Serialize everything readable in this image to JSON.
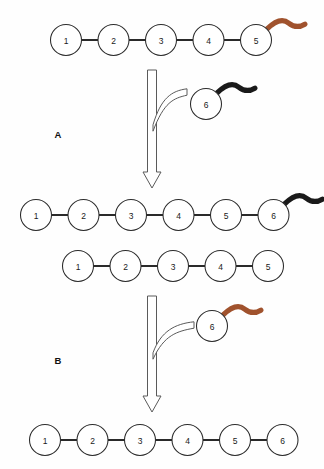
{
  "figure": {
    "background_color": "#fefefe",
    "ink_color": "#1f1f1f",
    "panels": [
      {
        "id": "A",
        "label": "A",
        "label_x": 58,
        "label_y": 134
      },
      {
        "id": "B",
        "label": "B",
        "label_x": 58,
        "label_y": 360
      }
    ],
    "colors": {
      "tail_brown": "#A0522D",
      "tail_black": "#1a1a1a",
      "circle_stroke": "#2b2b2b",
      "circle_fill": "#ffffff",
      "link": "#1f1f1f",
      "arrow_stroke": "#5a5a5a",
      "arrow_fill": "#ffffff"
    },
    "geometry": {
      "circle_radius": 15.5,
      "circle_spacing": 47.5
    },
    "chains": [
      {
        "name": "panel-a-substrate-chain",
        "panel": "A",
        "start_x": 66,
        "y": 40,
        "spacing": 47.5,
        "nodes": [
          "1",
          "2",
          "3",
          "4",
          "5"
        ],
        "tail": {
          "attached_to": "5",
          "color": "#A0522D",
          "color_name": "brown"
        }
      },
      {
        "name": "panel-a-incoming-unit",
        "panel": "A",
        "start_x": 206,
        "y": 104,
        "spacing": 47.5,
        "nodes": [
          "6"
        ],
        "tail": {
          "attached_to": "6",
          "color": "#1a1a1a",
          "color_name": "black"
        }
      },
      {
        "name": "panel-a-product-chain",
        "panel": "A",
        "start_x": 36,
        "y": 215,
        "spacing": 47.5,
        "nodes": [
          "1",
          "2",
          "3",
          "4",
          "5",
          "6"
        ],
        "tail": {
          "attached_to": "6",
          "color": "#1a1a1a",
          "color_name": "black"
        }
      },
      {
        "name": "panel-b-substrate-chain",
        "panel": "B",
        "start_x": 78,
        "y": 266,
        "spacing": 47.5,
        "nodes": [
          "1",
          "2",
          "3",
          "4",
          "5"
        ],
        "tail": null
      },
      {
        "name": "panel-b-incoming-unit",
        "panel": "B",
        "start_x": 212,
        "y": 326,
        "spacing": 47.5,
        "nodes": [
          "6"
        ],
        "tail": {
          "attached_to": "6",
          "color": "#A0522D",
          "color_name": "brown"
        }
      },
      {
        "name": "panel-b-product-chain",
        "panel": "B",
        "start_x": 45,
        "y": 440,
        "spacing": 47.5,
        "nodes": [
          "1",
          "2",
          "3",
          "4",
          "5",
          "6"
        ],
        "tail": null
      }
    ],
    "arrows": [
      {
        "name": "panel-a-reaction-arrow",
        "panel": "A",
        "x": 152,
        "y_top": 70,
        "y_tip": 188,
        "shaft_half_width": 4.5,
        "head_half_width": 9,
        "head_height": 16,
        "branch": {
          "name": "panel-a-branch-arrow",
          "from_x": 187,
          "from_y": 92,
          "to_x": 152,
          "to_y": 128
        }
      },
      {
        "name": "panel-b-reaction-arrow",
        "panel": "B",
        "x": 152,
        "y_top": 296,
        "y_tip": 412,
        "shaft_half_width": 4.5,
        "head_half_width": 9,
        "head_height": 16,
        "branch": {
          "name": "panel-b-branch-arrow",
          "from_x": 194,
          "from_y": 325,
          "to_x": 152,
          "to_y": 356
        }
      }
    ]
  }
}
